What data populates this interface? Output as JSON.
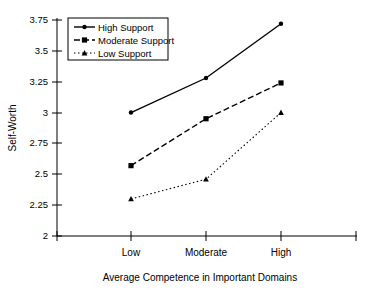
{
  "chart_data": {
    "type": "line",
    "title": "",
    "xlabel": "Average Competence in Important Domains",
    "ylabel": "Self-Worth",
    "categories": [
      "Low",
      "Moderate",
      "High"
    ],
    "ylim": [
      2,
      3.75
    ],
    "yticks": [
      "2",
      "2.25",
      "2.5",
      "2.75",
      "3",
      "3.25",
      "3.5",
      "3.75"
    ],
    "ytick_values": [
      2,
      2.25,
      2.5,
      2.75,
      3,
      3.25,
      3.5,
      3.75
    ],
    "grid": false,
    "legend_position": "top-left",
    "series": [
      {
        "name": "High Support",
        "values": [
          3.0,
          3.28,
          3.72
        ],
        "line_style": "solid",
        "marker": "circle",
        "color": "#000000"
      },
      {
        "name": "Moderate Support",
        "values": [
          2.57,
          2.95,
          3.24
        ],
        "line_style": "dashed",
        "marker": "square",
        "color": "#000000"
      },
      {
        "name": "Low Support",
        "values": [
          2.3,
          2.46,
          3.0
        ],
        "line_style": "dotted",
        "marker": "triangle",
        "color": "#000000"
      }
    ]
  },
  "axis": {
    "y_title": "Self-Worth",
    "x_title": "Average Competence in Important Domains",
    "y_tick_labels": [
      "3.75",
      "3.5",
      "3.25",
      "3",
      "2.75",
      "2.5",
      "2.25",
      "2"
    ],
    "x_tick_labels": [
      "Low",
      "Moderate",
      "High"
    ]
  },
  "legend": {
    "entries": [
      {
        "label": "High Support"
      },
      {
        "label": "Moderate Support"
      },
      {
        "label": "Low Support"
      }
    ]
  },
  "colors": {
    "ink": "#000000",
    "background": "#ffffff"
  }
}
